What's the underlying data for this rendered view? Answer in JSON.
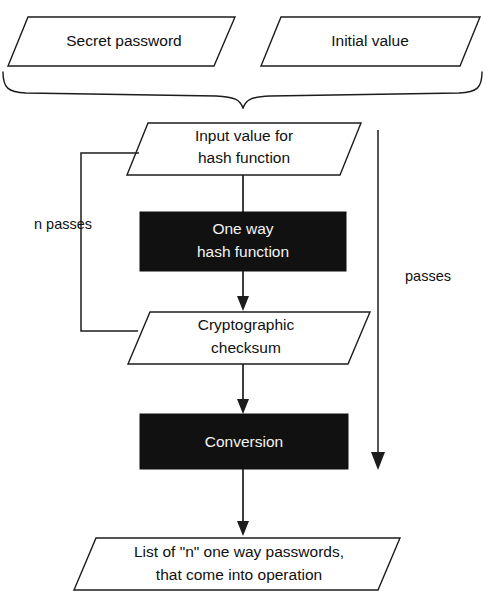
{
  "diagram": {
    "type": "flowchart",
    "colors": {
      "background": "#ffffff",
      "stroke": "#1c1c1c",
      "process_fill": "#111111",
      "process_text": "#f4f4f4",
      "io_fill": "#ffffff",
      "io_text": "#101010"
    },
    "inputs": [
      {
        "id": "secret-password",
        "shape": "parallelogram",
        "label": "Secret password"
      },
      {
        "id": "initial-value",
        "shape": "parallelogram",
        "label": "Initial value"
      }
    ],
    "nodes": [
      {
        "id": "input-value",
        "shape": "parallelogram",
        "kind": "data",
        "line1": "Input value for",
        "line2": "hash function"
      },
      {
        "id": "one-way-hash",
        "shape": "rectangle",
        "kind": "process",
        "line1": "One way",
        "line2": "hash function"
      },
      {
        "id": "crypto-checksum",
        "shape": "parallelogram",
        "kind": "data",
        "line1": "Cryptographic",
        "line2": "checksum"
      },
      {
        "id": "conversion",
        "shape": "rectangle",
        "kind": "process",
        "line1": "Conversion",
        "line2": ""
      },
      {
        "id": "output-list",
        "shape": "parallelogram",
        "kind": "data",
        "line1": "List of \"n\" one way passwords,",
        "line2": "that come into operation"
      }
    ],
    "edge_labels": {
      "loop_left": "n passes",
      "right_span": "passes"
    },
    "connectors": [
      {
        "id": "brace-merge",
        "from": "inputs",
        "to": "input-value",
        "style": "curly-brace"
      },
      {
        "id": "input-to-hash",
        "from": "input-value",
        "to": "one-way-hash",
        "arrow": true
      },
      {
        "id": "hash-to-checksum",
        "from": "one-way-hash",
        "to": "crypto-checksum",
        "arrow": true
      },
      {
        "id": "checksum-loop-back",
        "from": "crypto-checksum",
        "to": "input-value",
        "arrow": false,
        "label": "n passes"
      },
      {
        "id": "checksum-to-conversion",
        "from": "crypto-checksum",
        "to": "conversion",
        "arrow": true
      },
      {
        "id": "conversion-to-output",
        "from": "conversion",
        "to": "output-list",
        "arrow": true
      },
      {
        "id": "right-passes-span",
        "from": "input-value",
        "to": "output-list",
        "arrow": true,
        "label": "passes"
      }
    ]
  }
}
